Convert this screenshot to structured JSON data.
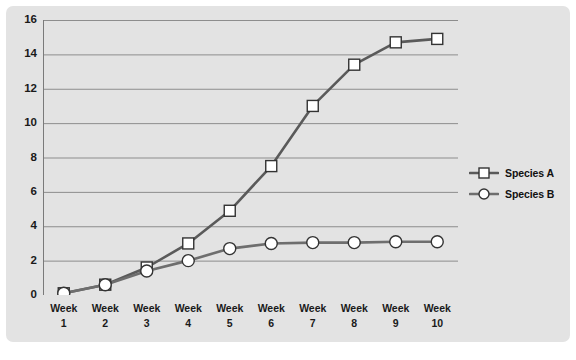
{
  "chart_data": {
    "type": "line",
    "title": "",
    "subtitle": "",
    "xlabel": "",
    "ylabel": "",
    "categories": [
      "Week 1",
      "Week 2",
      "Week 3",
      "Week 4",
      "Week 5",
      "Week 6",
      "Week 7",
      "Week 8",
      "Week 9",
      "Week 10"
    ],
    "category_lines": [
      [
        "Week",
        "1"
      ],
      [
        "Week",
        "2"
      ],
      [
        "Week",
        "3"
      ],
      [
        "Week",
        "4"
      ],
      [
        "Week",
        "5"
      ],
      [
        "Week",
        "6"
      ],
      [
        "Week",
        "7"
      ],
      [
        "Week",
        "8"
      ],
      [
        "Week",
        "9"
      ],
      [
        "Week",
        "10"
      ]
    ],
    "series": [
      {
        "name": "Species A",
        "marker": "square",
        "color": "#5a5a5a",
        "values": [
          0.1,
          0.6,
          1.6,
          3.0,
          4.9,
          7.5,
          11.0,
          13.4,
          14.7,
          14.9
        ]
      },
      {
        "name": "Species B",
        "marker": "circle",
        "color": "#6e6e6e",
        "values": [
          0.1,
          0.6,
          1.4,
          2.0,
          2.7,
          3.0,
          3.05,
          3.05,
          3.1,
          3.1
        ]
      }
    ],
    "yticks": [
      0,
      2,
      4,
      6,
      8,
      10,
      12,
      14,
      16
    ],
    "ylim": [
      0,
      16
    ],
    "grid": true,
    "grid_axis": "y",
    "legend_position": "right",
    "legend": [
      "Species A",
      "Species B"
    ]
  },
  "colors": {
    "panel_background": "#e3e3e3",
    "page_background": "#ffffff",
    "gridline": "#8d8d8d",
    "axis": "#7a7a7a",
    "text": "#1a1a1a",
    "series_a": "#5a5a5a",
    "series_b": "#6e6e6e",
    "marker_fill": "#ffffff"
  }
}
